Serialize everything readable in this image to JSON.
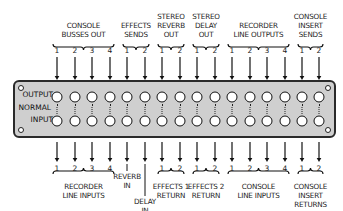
{
  "panel": {
    "row_labels": {
      "output": "OUTPUT",
      "normal": "NORMAL",
      "input": "INPUT"
    },
    "columns": 16,
    "column_x": [
      57,
      75,
      92,
      110,
      127,
      145,
      162,
      180,
      197,
      215,
      232,
      250,
      267,
      285,
      302,
      319
    ],
    "background": "#cfcfcf"
  },
  "top_groups": [
    {
      "label_lines": [
        "CONSOLE",
        "BUSSES OUT"
      ],
      "numbers": [
        "1",
        "2",
        "3",
        "4"
      ],
      "cols": [
        0,
        1,
        2,
        3
      ]
    },
    {
      "label_lines": [
        "EFFECTS",
        "SENDS"
      ],
      "numbers": [
        "1",
        "2"
      ],
      "cols": [
        4,
        5
      ]
    },
    {
      "label_lines": [
        "STEREO",
        "REVERB",
        "OUT"
      ],
      "numbers": [
        "1",
        "2"
      ],
      "cols": [
        6,
        7
      ]
    },
    {
      "label_lines": [
        "STEREO",
        "DELAY",
        "OUT"
      ],
      "numbers": [
        "1",
        "2"
      ],
      "cols": [
        8,
        9
      ]
    },
    {
      "label_lines": [
        "RECORDER",
        "LINE OUTPUTS"
      ],
      "numbers": [
        "1",
        "2",
        "3",
        "4"
      ],
      "cols": [
        10,
        11,
        12,
        13
      ]
    },
    {
      "label_lines": [
        "CONSOLE",
        "INSERT",
        "SENDS"
      ],
      "numbers": [
        "1",
        "2"
      ],
      "cols": [
        14,
        15
      ]
    }
  ],
  "bottom_groups": [
    {
      "label_lines": [
        "RECORDER",
        "LINE INPUTS"
      ],
      "numbers": [
        "1",
        "2",
        "3",
        "4"
      ],
      "cols": [
        0,
        1,
        2,
        3
      ]
    },
    {
      "label_lines": [
        "REVERB",
        "IN"
      ],
      "numbers": [],
      "cols": [
        4
      ]
    },
    {
      "label_lines": [
        "DELAY",
        "IN"
      ],
      "numbers": [],
      "cols": [
        5
      ]
    },
    {
      "label_lines": [
        "EFFECTS 1",
        "RETURN"
      ],
      "numbers": [
        "1",
        "2"
      ],
      "cols": [
        6,
        7
      ]
    },
    {
      "label_lines": [
        "EFFECTS 2",
        "RETURN"
      ],
      "numbers": [
        "1",
        "2"
      ],
      "cols": [
        8,
        9
      ]
    },
    {
      "label_lines": [
        "CONSOLE",
        "LINE INPUTS"
      ],
      "numbers": [
        "1",
        "2",
        "3",
        "4"
      ],
      "cols": [
        10,
        11,
        12,
        13
      ]
    },
    {
      "label_lines": [
        "CONSOLE",
        "INSERT",
        "RETURNS"
      ],
      "numbers": [
        "1",
        "2"
      ],
      "cols": [
        14,
        15
      ]
    }
  ]
}
